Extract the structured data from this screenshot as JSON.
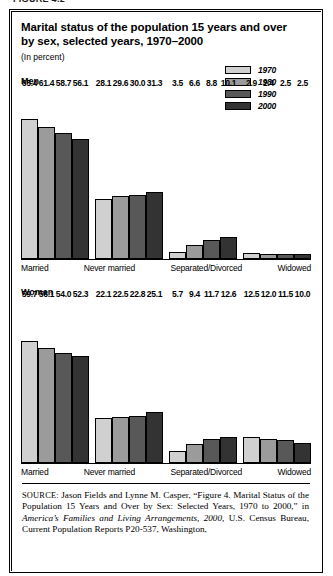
{
  "figure_number": "FIGURE 4.2",
  "title": "Marital status of the population 15 years and over by sex, selected years, 1970–2000",
  "subtitle": "(In percent)",
  "legend": {
    "items": [
      {
        "label": "1970",
        "color": "#d0d0d0"
      },
      {
        "label": "1980",
        "color": "#9b9b9b"
      },
      {
        "label": "1990",
        "color": "#585858"
      },
      {
        "label": "2000",
        "color": "#333333"
      }
    ]
  },
  "panels": [
    {
      "label": "Men"
    },
    {
      "label": "Women"
    }
  ],
  "source": {
    "kicker": "SOURCE:",
    "part1": " Jason Fields and Lynne M. Casper, “Figure 4. Marital Status of the Population 15 Years and Over by Sex: Selected Years, 1970 to 2000,” in ",
    "italic": "America’s Families and Living Arrangements, 2000,",
    "part2": " U.S. Census Bureau, Current Population Reports P20-537, Washington,"
  },
  "chart_data": [
    {
      "type": "bar",
      "title": "Men",
      "xlabel": "",
      "ylabel": "Percent",
      "ylim": [
        0,
        70
      ],
      "grid": false,
      "legend_position": "top-right",
      "categories": [
        "Married",
        "Never married",
        "Separated/Divorced",
        "Widowed"
      ],
      "series": [
        {
          "name": "1970",
          "color": "#d0d0d0",
          "values": [
            65.4,
            28.1,
            3.5,
            2.9
          ]
        },
        {
          "name": "1980",
          "color": "#9b9b9b",
          "values": [
            61.4,
            29.6,
            6.6,
            2.4
          ]
        },
        {
          "name": "1990",
          "color": "#585858",
          "values": [
            58.7,
            30.0,
            8.8,
            2.5
          ]
        },
        {
          "name": "2000",
          "color": "#333333",
          "values": [
            56.1,
            31.3,
            10.1,
            2.5
          ]
        }
      ]
    },
    {
      "type": "bar",
      "title": "Women",
      "xlabel": "",
      "ylabel": "Percent",
      "ylim": [
        0,
        70
      ],
      "grid": false,
      "legend_position": "top-right",
      "categories": [
        "Married",
        "Never married",
        "Separated/Divorced",
        "Widowed"
      ],
      "series": [
        {
          "name": "1970",
          "color": "#d0d0d0",
          "values": [
            59.7,
            22.1,
            5.7,
            12.5
          ]
        },
        {
          "name": "1980",
          "color": "#9b9b9b",
          "values": [
            56.1,
            22.5,
            9.4,
            12.0
          ]
        },
        {
          "name": "1990",
          "color": "#585858",
          "values": [
            54.0,
            22.8,
            11.7,
            11.5
          ]
        },
        {
          "name": "2000",
          "color": "#333333",
          "values": [
            52.3,
            25.1,
            12.6,
            10.0
          ]
        }
      ]
    }
  ]
}
